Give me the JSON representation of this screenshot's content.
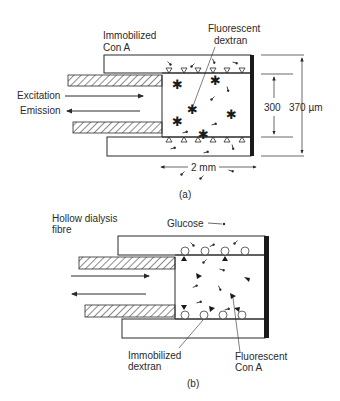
{
  "panel_a": {
    "caption": "(a)",
    "label_immobilized_line1": "Immobilized",
    "label_immobilized_line2": "Con A",
    "label_fluorescent_line1": "Fluorescent",
    "label_fluorescent_line2": "dextran",
    "label_excitation": "Excitation",
    "label_emission": "Emission",
    "dim_inner": "300",
    "dim_outer": "370 µm",
    "dim_length": "2 mm"
  },
  "panel_b": {
    "caption": "(b)",
    "label_fibre_line1": "Hollow dialysis",
    "label_fibre_line2": "fibre",
    "label_glucose": "Glucose",
    "label_immobilized_line1": "Immobilized",
    "label_immobilized_line2": "dextran",
    "label_fluorescent_line1": "Fluorescent",
    "label_fluorescent_line2": "Con A"
  },
  "colors": {
    "ink": "#2a2a2a",
    "background": "#ffffff"
  }
}
